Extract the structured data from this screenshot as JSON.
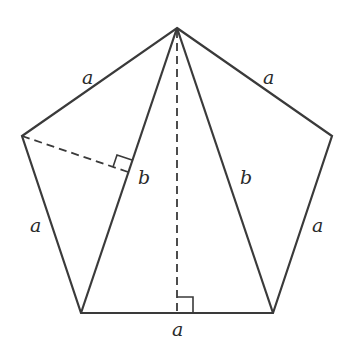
{
  "diagram": {
    "title": "",
    "shape": "regular-pentagon",
    "vertices": {
      "top": [
        177,
        28
      ],
      "upper_left": [
        22,
        136
      ],
      "upper_right": [
        332,
        136
      ],
      "lower_left": [
        81,
        313
      ],
      "lower_right": [
        273,
        313
      ]
    },
    "labels": {
      "side_top_left": "a",
      "side_top_right": "a",
      "side_left": "a",
      "side_right": "a",
      "side_bottom": "a",
      "diagonal_left": "b",
      "diagonal_right": "b"
    },
    "stroke_color": "#3a3a3a",
    "annotations": {
      "dashed_altitude_vertical": "from top vertex perpendicular to bottom side, right-angle mark",
      "dashed_perpendicular_left": "from upper-left vertex perpendicular to left diagonal, right-angle mark"
    }
  }
}
